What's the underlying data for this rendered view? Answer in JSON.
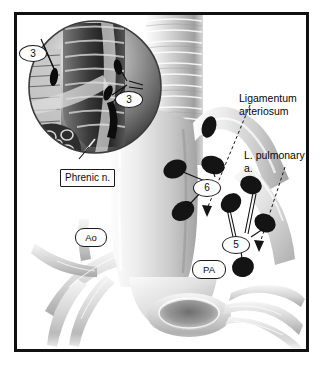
{
  "figure": {
    "frame_color": "#111111",
    "background_color": "#ffffff"
  },
  "inset": {
    "name": "magnified-circle-inset",
    "description": "Circular magnified view of trachea, bronchus and phrenic nerve region",
    "callouts": [
      {
        "id": "inset-node-3-left",
        "label": "3",
        "shape": "oval"
      },
      {
        "id": "inset-node-3-right",
        "label": "3",
        "shape": "oval"
      }
    ],
    "boxed_label": {
      "id": "phrenic-nerve-label",
      "label": "Phrenic n.",
      "shape": "rect"
    }
  },
  "main": {
    "name": "main-anatomy-illustration",
    "vessel_labels": [
      {
        "id": "aorta-label",
        "label": "Ao",
        "shape": "pill"
      },
      {
        "id": "pulmonary-artery-label",
        "label": "PA",
        "shape": "pill"
      }
    ],
    "station_callouts": [
      {
        "id": "station-6-label",
        "label": "6",
        "shape": "oval"
      },
      {
        "id": "station-5-label",
        "label": "5",
        "shape": "oval"
      }
    ],
    "text_labels": [
      {
        "id": "ligamentum-arteriosum-label",
        "label": "Ligamentum\narteriosum"
      },
      {
        "id": "left-pulmonary-artery-label",
        "label": "L. pulmonary a."
      }
    ]
  },
  "colors": {
    "node_fill": "#141414",
    "leader_line": "#101010",
    "tissue_light": "#f2f2f2",
    "tissue_mid": "#cfcfcf",
    "tissue_dark": "#8e8e8e",
    "inset_dark": "#2a2a2a"
  }
}
